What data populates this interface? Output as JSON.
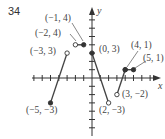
{
  "problem_number": "34",
  "chart_data": {
    "type": "line",
    "title": "",
    "xlabel": "x",
    "ylabel": "y",
    "grid": false,
    "xlim": [
      -7,
      8
    ],
    "ylim": [
      -7,
      8
    ],
    "segments": [
      {
        "from": [
          -5,
          -3
        ],
        "to": [
          -3,
          3
        ],
        "from_closed": true,
        "to_closed": false
      },
      {
        "from": [
          -2,
          4
        ],
        "to": [
          -1,
          4
        ],
        "from_closed": false,
        "to_closed": true
      },
      {
        "from": [
          0,
          3
        ],
        "to": [
          2,
          -3
        ],
        "from_closed": true,
        "to_closed": false
      },
      {
        "from": [
          3,
          -2
        ],
        "to": [
          4,
          1
        ],
        "from_closed": false,
        "to_closed": true
      },
      {
        "from": [
          4,
          1
        ],
        "to": [
          5,
          1
        ],
        "from_closed": true,
        "to_closed": true
      }
    ],
    "annotations": [
      {
        "text": "(−1, 4)",
        "point": [
          -1,
          4
        ]
      },
      {
        "text": "(−2, 4)",
        "point": [
          -2,
          4
        ]
      },
      {
        "text": "(−3, 3)",
        "point": [
          -3,
          3
        ]
      },
      {
        "text": "(0, 3)",
        "point": [
          0,
          3
        ]
      },
      {
        "text": "(4, 1)",
        "point": [
          4,
          1
        ]
      },
      {
        "text": "(5, 1)",
        "point": [
          5,
          1
        ]
      },
      {
        "text": "(−5, −3)",
        "point": [
          -5,
          -3
        ]
      },
      {
        "text": "(2, −3)",
        "point": [
          2,
          -3
        ]
      },
      {
        "text": "(3, −2)",
        "point": [
          3,
          -2
        ]
      }
    ]
  },
  "labels": {
    "x_axis": "x",
    "y_axis": "y",
    "p_m1_4": "(−1, 4)",
    "p_m2_4": "(−2, 4)",
    "p_m3_3": "(−3, 3)",
    "p_0_3": "(0, 3)",
    "p_4_1": "(4, 1)",
    "p_5_1": "(5, 1)",
    "p_m5_m3": "(−5, −3)",
    "p_2_m3": "(2, −3)",
    "p_3_m2": "(3, −2)"
  }
}
